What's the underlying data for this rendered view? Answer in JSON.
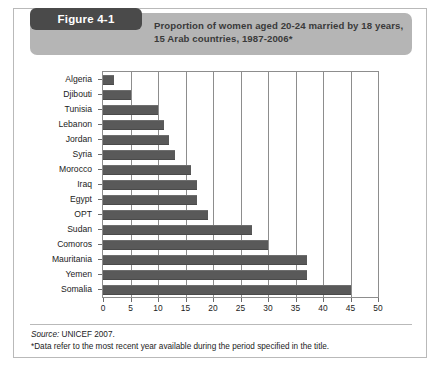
{
  "figure": {
    "tag_label": "Figure 4-1",
    "title": "Proportion of women aged 20-24 married by 18 years,\n15 Arab countries, 1987-2006*",
    "title_line1": "Proportion of women aged 20-24 married by 18 years,",
    "title_line2": "15 Arab countries, 1987-2006*"
  },
  "footer": {
    "source_word": "Source:",
    "source_text": " UNICEF 2007.",
    "note": "*Data refer to the most recent year available during the period specified in the title."
  },
  "colors": {
    "bar_fill": "#595959",
    "header_band": "#b5b5b5",
    "tag_background": "#4a4a4a",
    "axis": "#8d8d8d",
    "frame_border": "#b9b9b9"
  },
  "chart_data": {
    "type": "bar",
    "orientation": "horizontal",
    "title": "Proportion of women aged 20-24 married by 18 years, 15 Arab countries, 1987-2006*",
    "xlabel": "",
    "ylabel": "",
    "xlim": [
      0,
      50
    ],
    "xticks": [
      0,
      5,
      10,
      15,
      20,
      25,
      30,
      35,
      40,
      45,
      50
    ],
    "xtick_labels": [
      "0",
      "5",
      "10",
      "15",
      "20",
      "25",
      "30",
      "35",
      "40",
      "45",
      "50"
    ],
    "grid": true,
    "grid_axis": "x",
    "legend": false,
    "source": "UNICEF 2007.",
    "note": "*Data refer to the most recent year available during the period specified in the title.",
    "categories": [
      "Algeria",
      "Djibouti",
      "Tunisia",
      "Lebanon",
      "Jordan",
      "Syria",
      "Morocco",
      "Iraq",
      "Egypt",
      "OPT",
      "Sudan",
      "Comoros",
      "Mauritania",
      "Yemen",
      "Somalia"
    ],
    "values": [
      2,
      5,
      10,
      11,
      12,
      13,
      16,
      17,
      17,
      19,
      27,
      30,
      37,
      37,
      45
    ]
  }
}
